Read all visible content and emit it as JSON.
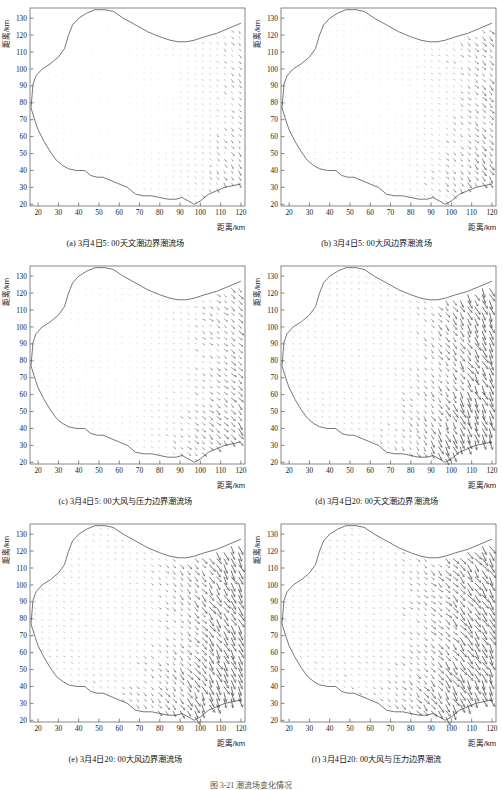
{
  "figure": {
    "title": "图 3-21  潮流场变化情况",
    "axes": {
      "x_label": "距离/km",
      "y_label": "距离/km",
      "x_ticks": [
        20,
        30,
        40,
        50,
        60,
        70,
        80,
        90,
        100,
        110,
        120
      ],
      "y_ticks": [
        20,
        30,
        40,
        50,
        60,
        70,
        80,
        90,
        100,
        110,
        120,
        130
      ],
      "xlim": [
        16,
        122
      ],
      "ylim": [
        19,
        136
      ]
    }
  },
  "panels": [
    {
      "tag": "(a)",
      "caption": "(a) 3月4日5: 00天文潮边界潮流场",
      "time": "3月4日5: 00",
      "condition": "天文潮边界潮流场",
      "field_strength": 0.3,
      "field_angle": -20
    },
    {
      "tag": "(b)",
      "caption": "(b) 3月4日5: 00大风边界潮流场",
      "time": "3月4日5: 00",
      "condition": "大风边界潮流场",
      "field_strength": 0.42,
      "field_angle": -18
    },
    {
      "tag": "(c)",
      "caption": "(c) 3月4日5: 00大风与压力边界潮流场",
      "time": "3月4日5: 00",
      "condition": "大风与压力边界潮流场",
      "field_strength": 0.46,
      "field_angle": -14
    },
    {
      "tag": "(d)",
      "caption": "(d) 3月4日20: 00天文潮边界潮流场",
      "time": "3月4日20: 00",
      "condition": "天文潮边界潮流场",
      "field_strength": 0.86,
      "field_angle": -34
    },
    {
      "tag": "(e)",
      "caption": "(e) 3月4日20: 00大风边界潮流场",
      "time": "3月4日20: 00",
      "condition": "大风边界潮流场",
      "field_strength": 0.94,
      "field_angle": -32
    },
    {
      "tag": "(f)",
      "caption": "(f) 3月4日20: 00大风与压力边界潮流",
      "time": "3月4日20: 00",
      "condition": "大风与压力边界潮流",
      "field_strength": 1.0,
      "field_angle": -28
    }
  ],
  "chart_data": {
    "type": "scatter",
    "title": "图 3-21  潮流场变化情况",
    "subtype": "quiver / vector field (6 subplots, 2 columns x 3 rows)",
    "xlabel": "距离/km",
    "ylabel": "距离/km",
    "xlim": [
      16,
      122
    ],
    "ylim": [
      19,
      136
    ],
    "grid": false,
    "legend": "none",
    "coastline_upper": [
      [
        16.5,
        77
      ],
      [
        17.0,
        84
      ],
      [
        17.5,
        91
      ],
      [
        19.0,
        96
      ],
      [
        22.0,
        100
      ],
      [
        26.0,
        103
      ],
      [
        30.0,
        107
      ],
      [
        33.0,
        112
      ],
      [
        35.0,
        120
      ],
      [
        37.0,
        126
      ],
      [
        40.0,
        130
      ],
      [
        44.0,
        133
      ],
      [
        48.0,
        135
      ],
      [
        53.0,
        135
      ],
      [
        57.0,
        134
      ],
      [
        62.0,
        130
      ],
      [
        68.0,
        126
      ],
      [
        74.0,
        122
      ],
      [
        80.0,
        119
      ],
      [
        85.0,
        117
      ],
      [
        89.0,
        116
      ],
      [
        93.0,
        116
      ],
      [
        97.0,
        117
      ],
      [
        102.0,
        119
      ],
      [
        108.0,
        121
      ],
      [
        114.0,
        124
      ],
      [
        120.0,
        127
      ]
    ],
    "coastline_lower": [
      [
        16.5,
        77
      ],
      [
        18.0,
        71
      ],
      [
        20.0,
        64
      ],
      [
        23.0,
        57
      ],
      [
        26.0,
        51
      ],
      [
        29.0,
        46
      ],
      [
        32.0,
        43
      ],
      [
        35.0,
        41
      ],
      [
        39.0,
        40
      ],
      [
        43.0,
        40
      ],
      [
        46.0,
        37
      ],
      [
        49.0,
        36
      ],
      [
        52.0,
        36
      ],
      [
        56.0,
        34
      ],
      [
        60.0,
        32
      ],
      [
        64.0,
        30
      ],
      [
        68.0,
        26
      ],
      [
        72.0,
        25
      ],
      [
        76.0,
        25
      ],
      [
        80.0,
        24
      ],
      [
        84.0,
        23
      ],
      [
        88.0,
        23
      ],
      [
        91.0,
        24
      ],
      [
        94.0,
        22
      ],
      [
        97.0,
        20
      ],
      [
        100.0,
        22
      ],
      [
        104.0,
        26
      ],
      [
        108.0,
        28
      ],
      [
        112.0,
        30
      ],
      [
        116.0,
        31
      ],
      [
        120.0,
        32
      ]
    ],
    "series": [
      {
        "name": "(a) 3月4日5: 00天文潮边界潮流场",
        "relative_magnitude": 0.3,
        "mean_direction_deg": -20
      },
      {
        "name": "(b) 3月4日5: 00大风边界潮流场",
        "relative_magnitude": 0.42,
        "mean_direction_deg": -18
      },
      {
        "name": "(c) 3月4日5: 00大风与压力边界潮流场",
        "relative_magnitude": 0.46,
        "mean_direction_deg": -14
      },
      {
        "name": "(d) 3月4日20: 00天文潮边界潮流场",
        "relative_magnitude": 0.86,
        "mean_direction_deg": -34
      },
      {
        "name": "(e) 3月4日20: 00大风边界潮流场",
        "relative_magnitude": 0.94,
        "mean_direction_deg": -32
      },
      {
        "name": "(f) 3月4日20: 00大风与压力边界潮流",
        "relative_magnitude": 1.0,
        "mean_direction_deg": -28
      }
    ]
  }
}
